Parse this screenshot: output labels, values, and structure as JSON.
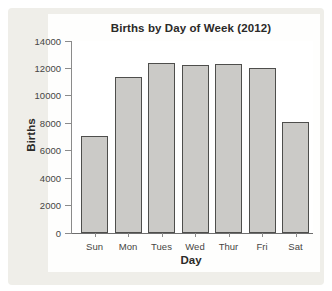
{
  "chart_data": {
    "type": "bar",
    "title": "Births by Day of Week (2012)",
    "xlabel": "Day",
    "ylabel": "Births",
    "categories": [
      "Sun",
      "Mon",
      "Tues",
      "Wed",
      "Thur",
      "Fri",
      "Sat"
    ],
    "values": [
      7100,
      11400,
      12400,
      12250,
      12300,
      12050,
      8100
    ],
    "ylim": [
      0,
      14000
    ],
    "yticks": [
      0,
      2000,
      4000,
      6000,
      8000,
      10000,
      12000,
      14000
    ],
    "grid": false,
    "legend": "none",
    "colors": {
      "bar_fill": "#cbcac7",
      "bar_border": "#4e4e4c",
      "axis": "#8b8b8b",
      "tick_text": "#464543",
      "title_text": "#2b2a28",
      "panel_bg": "#efeee9",
      "plot_bg": "#ffffff"
    }
  }
}
